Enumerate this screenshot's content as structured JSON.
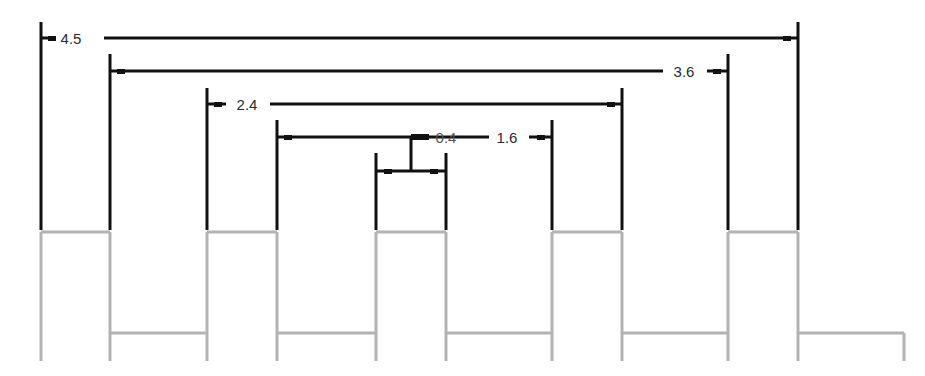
{
  "diagram": {
    "type": "timing-dimension-diagram",
    "colors": {
      "dimension_lines": "#111111",
      "waveform": "#b3b3b3",
      "background": "#ffffff",
      "label_text": "#2b2b2b"
    },
    "dimensions": [
      {
        "label": "4.5",
        "x1": 41,
        "x2": 798,
        "y": 38,
        "top": 22
      },
      {
        "label": "3.6",
        "x1": 110,
        "x2": 728,
        "y": 71,
        "top": 54
      },
      {
        "label": "2.4",
        "x1": 207,
        "x2": 622,
        "y": 104,
        "top": 88
      },
      {
        "label": "1.6",
        "x1": 277,
        "x2": 552,
        "y": 137,
        "top": 120
      },
      {
        "label": "0.4",
        "x1": 376,
        "x2": 446,
        "y": 171,
        "top": 153
      }
    ],
    "waveform": {
      "high_y": 232,
      "low_y": 333,
      "bottom_y": 361,
      "pulses": [
        {
          "start": 41,
          "end": 110
        },
        {
          "start": 207,
          "end": 277
        },
        {
          "start": 376,
          "end": 446
        },
        {
          "start": 552,
          "end": 622
        },
        {
          "start": 728,
          "end": 798
        }
      ],
      "end_x": 904
    }
  }
}
